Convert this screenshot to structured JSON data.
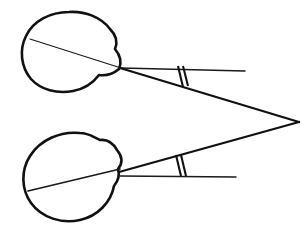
{
  "diagram": {
    "canvas": {
      "width": 301,
      "height": 232,
      "background": "#ffffff"
    },
    "colors": {
      "ink": "#111111",
      "ink_light": "#1a1a1a",
      "paper": "#ffffff"
    },
    "fixation_point": {
      "label": "fixation point",
      "x": 299,
      "y": 122
    },
    "eyes": [
      {
        "id": "upper-eye",
        "label": "upper eye",
        "center": {
          "x": 70,
          "y": 51
        },
        "radius_x": 48,
        "radius_y": 39,
        "node": {
          "x": 120,
          "y": 68
        },
        "outline_path": "M 119 69 C 122 62 120 55 115 49 C 118 42 116 35 110 29 C 101 17 85 11 69 12 C 50 12 33 21 26 36 C 19 50 21 67 31 79 C 41 90 57 94 73 91 C 84 89 93 83 99 75 C 106 76 113 74 119 69 Z",
        "visual_axis": {
          "x1": 30,
          "y1": 39,
          "x2": 121,
          "y2": 68
        },
        "optic_axis_ray": {
          "x1": 121,
          "y1": 68,
          "x2": 245,
          "y2": 71
        },
        "sight_ray": {
          "x1": 120,
          "y1": 68,
          "x2": 299,
          "y2": 122
        },
        "angle_marker": {
          "kind": "double-tick",
          "ticks": [
            {
              "x1": 178,
              "y1": 66,
              "x2": 183,
              "y2": 87
            },
            {
              "x1": 183,
              "y1": 66,
              "x2": 188,
              "y2": 86
            }
          ]
        }
      },
      {
        "id": "lower-eye",
        "label": "lower eye",
        "center": {
          "x": 70,
          "y": 178
        },
        "radius_x": 48,
        "radius_y": 43,
        "node": {
          "x": 119,
          "y": 170
        },
        "outline_path": "M 118 169 C 123 163 122 156 117 150 C 113 143 107 139 100 140 C 93 137 89 133 80 133 C 60 131 40 140 30 156 C 21 170 21 189 31 203 C 42 218 62 224 80 220 C 98 216 111 202 114 186 C 118 181 120 175 118 169 Z",
        "visual_axis": {
          "x1": 28,
          "y1": 191,
          "x2": 120,
          "y2": 169
        },
        "optic_axis_ray": {
          "x1": 120,
          "y1": 176,
          "x2": 236,
          "y2": 177
        },
        "sight_ray": {
          "x1": 119,
          "y1": 172,
          "x2": 299,
          "y2": 122
        },
        "angle_marker": {
          "kind": "double-tick",
          "ticks": [
            {
              "x1": 176,
              "y1": 155,
              "x2": 181,
              "y2": 176
            },
            {
              "x1": 181,
              "y1": 155,
              "x2": 186,
              "y2": 176
            }
          ]
        }
      }
    ]
  }
}
